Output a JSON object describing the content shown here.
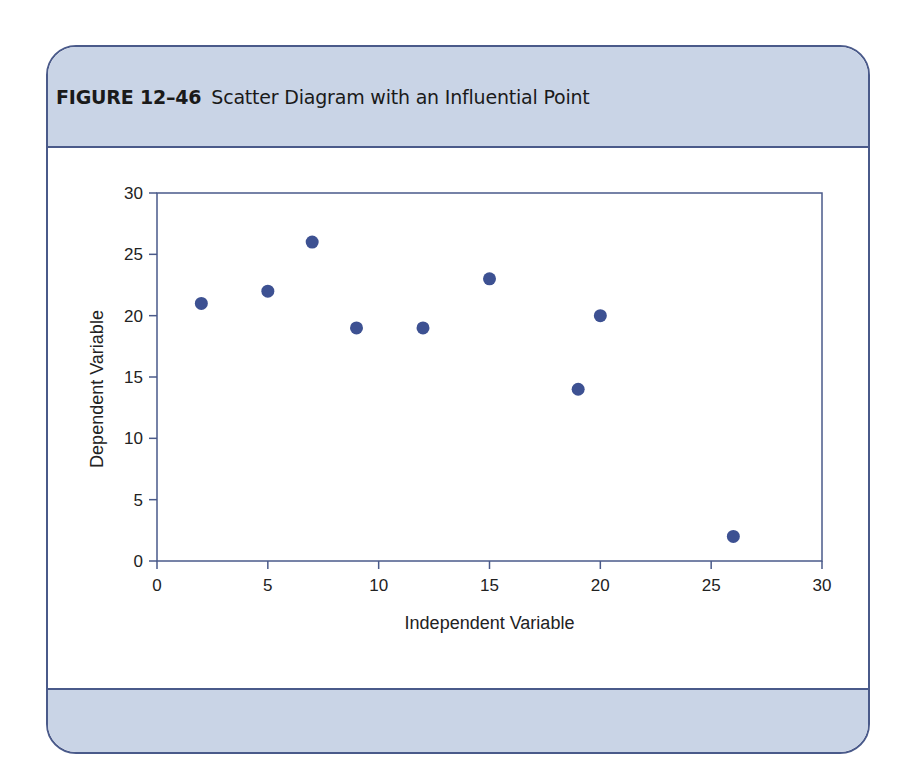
{
  "figure": {
    "label": "FIGURE 12–46",
    "caption": "Scatter Diagram with an Influential Point"
  },
  "colors": {
    "frame": "#4a5a8a",
    "band": "#c9d4e6",
    "point": "#3d5192",
    "axis": "#4a5a8a"
  },
  "chart_data": {
    "type": "scatter",
    "title": "Scatter Diagram with an Influential Point",
    "xlabel": "Independent Variable",
    "ylabel": "Dependent Variable",
    "xlim": [
      0,
      30
    ],
    "ylim": [
      0,
      30
    ],
    "x_ticks": [
      0,
      5,
      10,
      15,
      20,
      25,
      30
    ],
    "y_ticks": [
      0,
      5,
      10,
      15,
      20,
      25,
      30
    ],
    "grid": false,
    "legend": null,
    "series": [
      {
        "name": "Data",
        "points": [
          {
            "x": 2,
            "y": 21
          },
          {
            "x": 5,
            "y": 22
          },
          {
            "x": 7,
            "y": 26
          },
          {
            "x": 9,
            "y": 19
          },
          {
            "x": 12,
            "y": 19
          },
          {
            "x": 15,
            "y": 23
          },
          {
            "x": 19,
            "y": 14
          },
          {
            "x": 20,
            "y": 20
          },
          {
            "x": 26,
            "y": 2
          }
        ]
      }
    ],
    "annotations": [
      "Point at (26, 2) is the influential point"
    ]
  }
}
